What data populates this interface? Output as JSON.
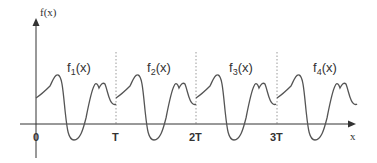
{
  "diagram": {
    "y_axis_label": "f(x)",
    "x_axis_label": "x",
    "tick_labels": [
      "0",
      "T",
      "2T",
      "3T"
    ],
    "segments": [
      {
        "label_base": "f",
        "label_sub": "1",
        "label_tail": "(x)"
      },
      {
        "label_base": "f",
        "label_sub": "2",
        "label_tail": "(x)"
      },
      {
        "label_base": "f",
        "label_sub": "3",
        "label_tail": "(x)"
      },
      {
        "label_base": "f",
        "label_sub": "4",
        "label_tail": "(x)"
      }
    ],
    "colors": {
      "curve": "#555555",
      "axis": "#333333",
      "divider": "#9a9a9a"
    }
  }
}
